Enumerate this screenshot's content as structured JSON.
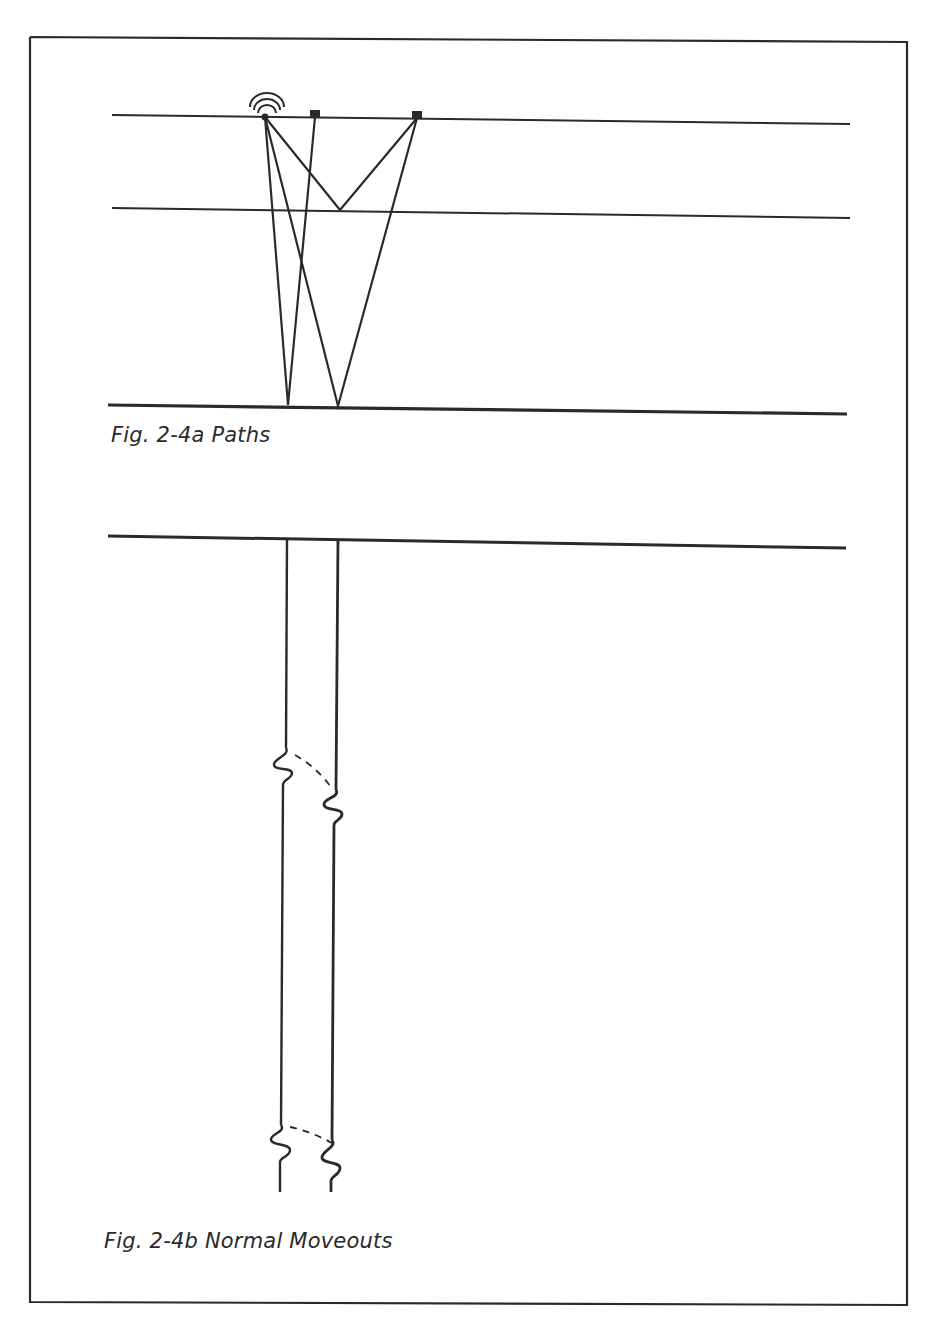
{
  "figure_a": {
    "caption": "Fig. 2-4a Paths",
    "layers": [
      "surface",
      "shallow reflector",
      "deep reflector"
    ],
    "elements": {
      "source": "source-icon (shot point with radiating wavefronts)",
      "receivers": 2
    }
  },
  "figure_b": {
    "caption": "Fig. 2-4b Normal Moveouts",
    "traces": 2,
    "events": 2
  },
  "colors": {
    "ink": "#2a2a2a",
    "paper": "#ffffff"
  }
}
